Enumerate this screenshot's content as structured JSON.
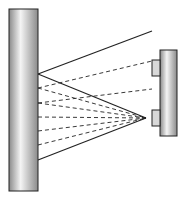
{
  "diagram": {
    "canvas": {
      "width": 185,
      "height": 204,
      "background": "#ffffff"
    },
    "colors": {
      "stroke": "#222222",
      "pillar_light": "#f4f4f4",
      "pillar_dark": "#8a8a8a"
    },
    "left_pillar": {
      "x": 9,
      "y": 9,
      "w": 29,
      "h": 182
    },
    "right_pillar": {
      "x": 160,
      "y": 50,
      "w": 17,
      "h": 86
    },
    "blocks": [
      {
        "x": 152,
        "y": 60,
        "w": 8,
        "h": 16
      },
      {
        "x": 152,
        "y": 110,
        "w": 8,
        "h": 16
      }
    ],
    "solid_lines": [
      {
        "x1": 38,
        "y1": 74,
        "x2": 152,
        "y2": 31
      },
      {
        "x1": 38,
        "y1": 74,
        "x2": 146,
        "y2": 118
      },
      {
        "x1": 38,
        "y1": 160,
        "x2": 146,
        "y2": 118
      }
    ],
    "dashed_lines": [
      {
        "x1": 38,
        "y1": 88,
        "x2": 152,
        "y2": 61
      },
      {
        "x1": 38,
        "y1": 103,
        "x2": 152,
        "y2": 89
      },
      {
        "x1": 38,
        "y1": 88,
        "x2": 146,
        "y2": 118
      },
      {
        "x1": 38,
        "y1": 103,
        "x2": 146,
        "y2": 118
      },
      {
        "x1": 38,
        "y1": 117,
        "x2": 146,
        "y2": 118
      },
      {
        "x1": 38,
        "y1": 131,
        "x2": 146,
        "y2": 118
      },
      {
        "x1": 38,
        "y1": 145,
        "x2": 146,
        "y2": 118
      }
    ],
    "focus_point": {
      "x": 146,
      "y": 118
    }
  }
}
